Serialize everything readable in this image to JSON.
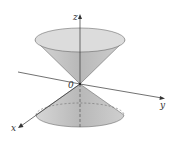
{
  "diagram": {
    "axes": {
      "x_label": "x",
      "y_label": "y",
      "z_label": "z",
      "origin_label": "0"
    },
    "colors": {
      "cone_fill": "#c8c8c8",
      "cone_rim": "#d9d9d9",
      "axis": "#333333"
    }
  }
}
